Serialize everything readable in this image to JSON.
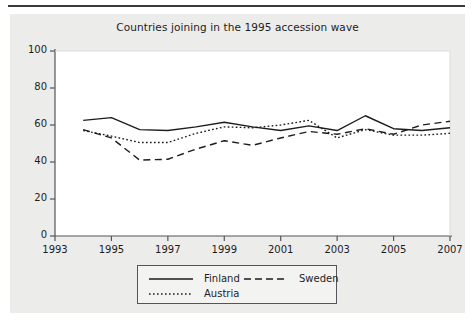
{
  "figure": {
    "title": "Countries joining in the 1995 accession wave",
    "background_color": "#ececeb",
    "plot_background_color": "#ffffff",
    "frame_color": "#55545a",
    "line_color": "#1d1d1d"
  },
  "chart_data": {
    "type": "line",
    "title": "Countries joining in the 1995 accession wave",
    "xlabel": "",
    "ylabel": "",
    "xlim": [
      1993,
      2007
    ],
    "ylim": [
      0,
      100
    ],
    "grid": false,
    "legend_position": "bottom-center",
    "x_ticks": [
      1993,
      1995,
      1997,
      1999,
      2001,
      2003,
      2005,
      2007
    ],
    "y_ticks": [
      0,
      20,
      40,
      60,
      80,
      100
    ],
    "x": [
      1994,
      1995,
      1996,
      1997,
      1998,
      1999,
      2000,
      2001,
      2002,
      2003,
      2004,
      2005,
      2006,
      2007
    ],
    "series": [
      {
        "name": "Finland",
        "style": "solid",
        "values": [
          62.5,
          64,
          57.5,
          57,
          59,
          61.5,
          59,
          57,
          59.5,
          57,
          65,
          58,
          57,
          58.5
        ]
      },
      {
        "name": "Sweden",
        "style": "dashed",
        "values": [
          57.5,
          53,
          41,
          41.5,
          47,
          51.5,
          49,
          53,
          56.5,
          55,
          58,
          55,
          60,
          62
        ]
      },
      {
        "name": "Austria",
        "style": "dotted",
        "values": [
          57,
          54,
          50.5,
          50.5,
          55.5,
          59,
          58.5,
          60,
          62.5,
          53,
          57.5,
          54.5,
          54.5,
          55.5
        ]
      }
    ]
  },
  "legend": {
    "entries": [
      {
        "label": "Finland",
        "style": "solid"
      },
      {
        "label": "Sweden",
        "style": "dashed"
      },
      {
        "label": "Austria",
        "style": "dotted"
      }
    ]
  },
  "axes": {
    "y_tick_labels": [
      "100",
      "80",
      "60",
      "40",
      "20",
      "0"
    ],
    "x_tick_labels": [
      "1993",
      "1995",
      "1997",
      "1999",
      "2001",
      "2003",
      "2005",
      "2007"
    ]
  }
}
